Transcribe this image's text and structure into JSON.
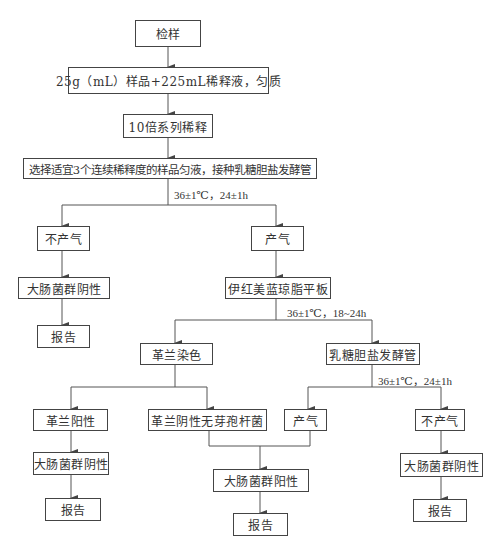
{
  "flowchart": {
    "start": "检样",
    "homogenize": "25g（mL）样品+225mL稀释液，匀质",
    "dilution": "10倍系列稀释",
    "inoculate": "选择适宜3个连续稀释度的样品匀液，接种乳糖胆盐发酵管",
    "incubation_1": "36±1℃，24±1h",
    "no_gas_1": "不产气",
    "gas_1": "产气",
    "negative_1": "大肠菌群阴性",
    "report_1": "报告",
    "emb_plate": "伊红美蓝琼脂平板",
    "incubation_2": "36±1℃，18~24h",
    "gram_stain": "革兰染色",
    "lactose_tube": "乳糖胆盐发酵管",
    "incubation_3": "36±1℃，24±1h",
    "gram_positive": "革兰阳性",
    "gram_negative_bacilli": "革兰阴性无芽孢杆菌",
    "gas_2": "产气",
    "no_gas_2": "不产气",
    "negative_2": "大肠菌群阴性",
    "report_2": "报告",
    "positive": "大肠菌群阳性",
    "report_3": "报告",
    "negative_3": "大肠菌群阴性",
    "report_4": "报告"
  }
}
